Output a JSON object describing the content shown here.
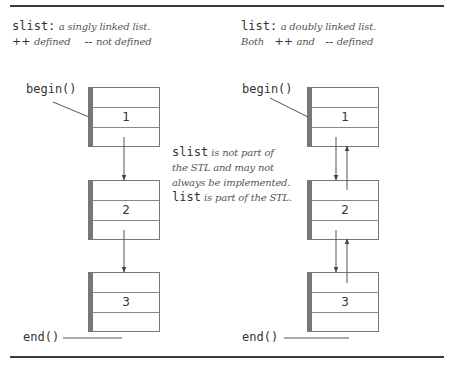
{
  "left_panel": {
    "title_code": "slist:",
    "title_desc": "a singly linked list.",
    "op_inc": "++",
    "op_inc_desc": "defined",
    "op_dec": "--",
    "op_dec_desc": "not defined",
    "begin_label": "begin()",
    "end_label": "end()",
    "nodes": [
      {
        "value": "1"
      },
      {
        "value": "2"
      },
      {
        "value": "3"
      }
    ]
  },
  "right_panel": {
    "title_code": "list:",
    "title_desc": "a doubly linked list.",
    "both_label": "Both",
    "op_inc": "++",
    "and_label": "and",
    "op_dec": "--",
    "op_dec_desc": "defined",
    "begin_label": "begin()",
    "end_label": "end()",
    "nodes": [
      {
        "value": "1"
      },
      {
        "value": "2"
      },
      {
        "value": "3"
      }
    ]
  },
  "note": {
    "slist_code": "slist",
    "slist_text_1": "is not part of",
    "slist_text_2": "the STL and may not",
    "slist_text_3": "always be implemented.",
    "list_code": "list",
    "list_text": "is part of the STL."
  },
  "colors": {
    "rule": "#3a3a3a",
    "box_border": "#777777",
    "text": "#333333"
  }
}
